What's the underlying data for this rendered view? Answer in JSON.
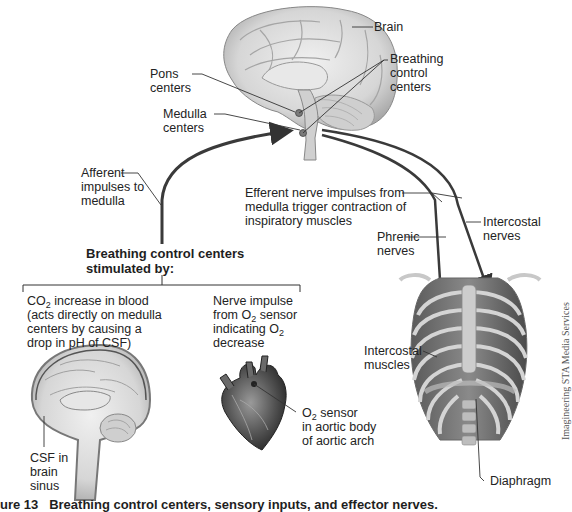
{
  "figure": {
    "caption_number": "ure 13",
    "caption_text": "Breathing control centers, sensory inputs, and effector nerves.",
    "credit": "Imagineering STA Media Services"
  },
  "labels": {
    "brain": "Brain",
    "breathing_control_centers": [
      "Breathing",
      "control",
      "centers"
    ],
    "pons_centers": [
      "Pons",
      "centers"
    ],
    "medulla_centers": [
      "Medulla",
      "centers"
    ],
    "afferent": [
      "Afferent",
      "impulses to",
      "medulla"
    ],
    "efferent": [
      "Efferent nerve impulses from",
      "medulla trigger contraction of",
      "inspiratory muscles"
    ],
    "intercostal_nerves": [
      "Intercostal",
      "nerves"
    ],
    "phrenic_nerves": [
      "Phrenic",
      "nerves"
    ],
    "stimulated_by": [
      "Breathing control centers",
      "stimulated by:"
    ],
    "co2_input": {
      "line1_pre": "CO",
      "line1_sub": "2",
      "line1_post": " increase in blood",
      "line2": "(acts directly on medulla",
      "line3": "centers by causing a",
      "line4": "drop in pH of CSF)"
    },
    "o2_input": {
      "line1": "Nerve impulse",
      "line2_pre": "from O",
      "line2_sub": "2",
      "line2_post": " sensor",
      "line3_pre": "indicating O",
      "line3_sub": "2",
      "line4": "decrease"
    },
    "o2_sensor": {
      "line1_pre": "O",
      "line1_sub": "2",
      "line1_post": " sensor",
      "line2": "in aortic body",
      "line3": "of aortic arch"
    },
    "csf": [
      "CSF in",
      "brain",
      "sinus"
    ],
    "intercostal_muscles": [
      "Intercostal",
      "muscles"
    ],
    "diaphragm": "Diaphragm"
  },
  "colors": {
    "arrow": "#3a3a3a",
    "tissue_light": "#e2e2e2",
    "tissue_mid": "#bdbdbd",
    "tissue_dark": "#6e6e6e",
    "text": "#232323"
  }
}
